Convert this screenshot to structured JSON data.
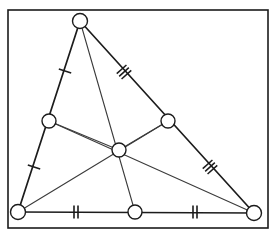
{
  "figure": {
    "canvas": {
      "width": 275,
      "height": 237
    },
    "colors": {
      "background": "#ffffff",
      "frame_stroke": "#1b1b1b",
      "side_stroke": "#1c1c1c",
      "median_stroke": "#3b3b3b",
      "midsegment_stroke": "#3b3b3b",
      "tick_stroke": "#1b1b1b",
      "node_fill": "#ffffff",
      "node_stroke": "#1b1b1b"
    },
    "frame": {
      "x": 8,
      "y": 10,
      "width": 260,
      "height": 218,
      "stroke_width": 1.6
    }
  },
  "points": {
    "apex": {
      "name": "apex-vertex",
      "x": 80,
      "y": 21,
      "r": 7.5
    },
    "bottom_left": {
      "name": "bottom-left-vertex",
      "x": 18,
      "y": 212,
      "r": 7.5
    },
    "bottom_right": {
      "name": "bottom-right-vertex",
      "x": 254,
      "y": 213,
      "r": 7.5
    },
    "left_midpoint": {
      "name": "left-side-midpoint",
      "x": 49,
      "y": 121,
      "r": 7
    },
    "right_midpoint": {
      "name": "right-side-midpoint",
      "x": 168,
      "y": 121,
      "r": 7
    },
    "bottom_midpoint": {
      "name": "bottom-side-midpoint",
      "x": 135,
      "y": 212,
      "r": 7
    },
    "centroid": {
      "name": "centroid",
      "x": 119,
      "y": 150,
      "r": 7
    }
  },
  "sides": [
    {
      "name": "side-apex-to-bottom-left",
      "x1": 80,
      "y1": 21,
      "x2": 18,
      "y2": 212,
      "stroke_width": 1.7
    },
    {
      "name": "side-apex-to-bottom-right",
      "x1": 80,
      "y1": 21,
      "x2": 254,
      "y2": 213,
      "stroke_width": 1.7
    },
    {
      "name": "side-bottom-left-to-bottom-right",
      "x1": 18,
      "y1": 212,
      "x2": 254,
      "y2": 213,
      "stroke_width": 1.7
    }
  ],
  "medians": [
    {
      "name": "median-apex-to-bottom-midpoint",
      "x1": 80,
      "y1": 21,
      "x2": 135,
      "y2": 212,
      "stroke_width": 1.1
    },
    {
      "name": "median-bottom-left-to-right-midpoint",
      "x1": 18,
      "y1": 212,
      "x2": 168,
      "y2": 121,
      "stroke_width": 1.1
    },
    {
      "name": "median-bottom-right-to-left-midpoint",
      "x1": 254,
      "y1": 213,
      "x2": 49,
      "y2": 121,
      "stroke_width": 1.1
    }
  ],
  "midsegments": [
    {
      "name": "midsegment-left-to-centroid",
      "x1": 49,
      "y1": 121,
      "x2": 119,
      "y2": 150,
      "stroke_width": 1.1
    },
    {
      "name": "midsegment-centroid-to-right",
      "x1": 119,
      "y1": 150,
      "x2": 168,
      "y2": 121,
      "stroke_width": 1.1
    }
  ],
  "tick_marks": [
    {
      "name": "tick-group-upper-left-single",
      "count": 1,
      "x": 65,
      "y": 71,
      "angle": -72,
      "length": 13,
      "spacing": 4,
      "stroke_width": 1.5
    },
    {
      "name": "tick-group-lower-left-single",
      "count": 1,
      "x": 34,
      "y": 167,
      "angle": -72,
      "length": 13,
      "spacing": 4,
      "stroke_width": 1.5
    },
    {
      "name": "tick-group-upper-right-triple",
      "count": 3,
      "x": 124,
      "y": 72,
      "angle": 48,
      "length": 13,
      "spacing": 3.6,
      "stroke_width": 1.5
    },
    {
      "name": "tick-group-lower-right-triple",
      "count": 3,
      "x": 210,
      "y": 167,
      "angle": 48,
      "length": 13,
      "spacing": 3.6,
      "stroke_width": 1.5
    },
    {
      "name": "tick-group-bottom-left-double",
      "count": 2,
      "x": 76,
      "y": 212,
      "angle": 0,
      "length": 13,
      "spacing": 4,
      "stroke_width": 1.6
    },
    {
      "name": "tick-group-bottom-right-double",
      "count": 2,
      "x": 195,
      "y": 212,
      "angle": 0,
      "length": 13,
      "spacing": 4,
      "stroke_width": 1.6
    }
  ]
}
